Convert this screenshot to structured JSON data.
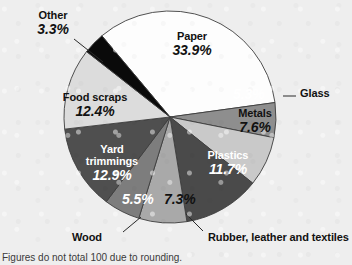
{
  "figure": {
    "footnote": "Figures do not total 100 due to rounding.",
    "background_color": "#eeeeee"
  },
  "chart_data": {
    "type": "pie",
    "title": "",
    "subtitle": "",
    "xlabel": "",
    "ylabel": "",
    "units": "percent",
    "legend_position": "none",
    "grid": false,
    "note": "Figures do not total 100 due to rounding.",
    "start_angle_deg": -40,
    "direction": "clockwise",
    "total": 99.9,
    "categories": [
      "Paper",
      "Glass",
      "Metals",
      "Plastics",
      "Rubber, leather and textiles",
      "Wood",
      "Yard trimmings",
      "Food scraps",
      "Other"
    ],
    "values": [
      33.9,
      5.3,
      7.6,
      11.7,
      7.3,
      5.5,
      12.9,
      12.4,
      3.3
    ],
    "slices": [
      {
        "label": "Paper",
        "value": 33.9,
        "value_text": "33.9%",
        "color": "#fdfdfd",
        "text_color": "#111111",
        "label_placement": "inside"
      },
      {
        "label": "Glass",
        "value": 5.3,
        "value_text": "5.3%",
        "color": "#8e8e8e",
        "text_color": "#ffffff",
        "label_placement": "callout"
      },
      {
        "label": "Metals",
        "value": 7.6,
        "value_text": "7.6%",
        "color": "#c9c9c9",
        "text_color": "#111111",
        "label_placement": "inside"
      },
      {
        "label": "Plastics",
        "value": 11.7,
        "value_text": "11.7%",
        "color": "#4a4a4a",
        "text_color": "#ffffff",
        "label_placement": "inside"
      },
      {
        "label": "Rubber, leather and textiles",
        "value": 7.3,
        "value_text": "7.3%",
        "color": "#a9a9a9",
        "text_color": "#111111",
        "label_placement": "callout"
      },
      {
        "label": "Wood",
        "value": 5.5,
        "value_text": "5.5%",
        "color": "#7d7d7d",
        "text_color": "#ffffff",
        "label_placement": "callout"
      },
      {
        "label": "Yard trimmings",
        "value": 12.9,
        "value_text": "12.9%",
        "color": "#4f4f4f",
        "text_color": "#ffffff",
        "label_placement": "inside"
      },
      {
        "label": "Food scraps",
        "value": 12.4,
        "value_text": "12.4%",
        "color": "#dcdcdc",
        "text_color": "#111111",
        "label_placement": "inside"
      },
      {
        "label": "Other",
        "value": 3.3,
        "value_text": "3.3%",
        "color": "#0a0a0a",
        "text_color": "#111111",
        "label_placement": "callout"
      }
    ]
  },
  "labels": {
    "other": {
      "name": "Other",
      "percent": "3.3%"
    },
    "paper": {
      "name": "Paper",
      "percent": "33.9%"
    },
    "glass": {
      "name": "Glass",
      "percent": "5.3%"
    },
    "metals": {
      "name": "Metals",
      "percent": "7.6%"
    },
    "plastics": {
      "name": "Plastics",
      "percent": "11.7%"
    },
    "rubber": {
      "name": "Rubber, leather and textiles",
      "percent": "7.3%"
    },
    "wood": {
      "name": "Wood",
      "percent": "5.5%"
    },
    "yard": {
      "name": "Yard",
      "name2": "trimmings",
      "percent": "12.9%"
    },
    "food": {
      "name": "Food scraps",
      "percent": "12.4%"
    }
  }
}
